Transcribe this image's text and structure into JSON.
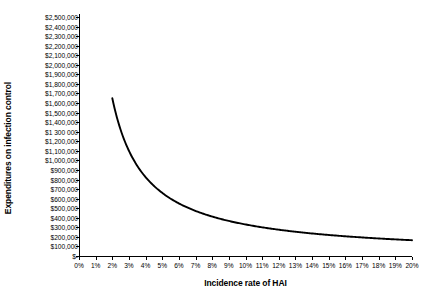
{
  "chart_data": {
    "type": "line",
    "title": "",
    "xlabel": "Incidence rate of HAI",
    "ylabel": "Expenditures on infection control",
    "xlim": [
      0,
      20
    ],
    "ylim": [
      0,
      2500000
    ],
    "grid": false,
    "legend": "none",
    "line_color": "#000000",
    "background_color": "#ffffff",
    "axis_color": "#000000",
    "x_tick_labels": [
      "0%",
      "1%",
      "2%",
      "3%",
      "4%",
      "5%",
      "6%",
      "7%",
      "8%",
      "9%",
      "10%",
      "11%",
      "12%",
      "13%",
      "14%",
      "15%",
      "16%",
      "17%",
      "18%",
      "19%",
      "20%"
    ],
    "x_tick_values": [
      0,
      1,
      2,
      3,
      4,
      5,
      6,
      7,
      8,
      9,
      10,
      11,
      12,
      13,
      14,
      15,
      16,
      17,
      18,
      19,
      20
    ],
    "y_tick_labels": [
      "$2,500,000",
      "$2,400,000",
      "$2,300,000",
      "$2,200,000",
      "$2,100,000",
      "$2,000,000",
      "$1,900,000",
      "$1,800,000",
      "$1,700,000",
      "$1,600,000",
      "$1,500,000",
      "$1,400,000",
      "$1 300 000",
      "$1,200,000",
      "$1,100,000",
      "$1,000,000",
      "$900,000",
      "$800,000",
      "$700,000",
      "$600,000",
      "$500,000",
      "$400,000",
      "$300,000",
      "$200,000",
      "$100,000",
      "$-"
    ],
    "y_tick_values": [
      2500000,
      2400000,
      2300000,
      2200000,
      2100000,
      2000000,
      1900000,
      1800000,
      1700000,
      1600000,
      1500000,
      1400000,
      1300000,
      1200000,
      1100000,
      1000000,
      900000,
      800000,
      700000,
      600000,
      500000,
      400000,
      300000,
      200000,
      100000,
      0
    ],
    "x": [
      2.0,
      2.5,
      3.0,
      3.5,
      4.0,
      4.5,
      5.0,
      5.5,
      6.0,
      6.5,
      7.0,
      7.5,
      8.0,
      8.5,
      9.0,
      9.5,
      10.0,
      10.5,
      11.0,
      11.5,
      12.0,
      12.5,
      13.0,
      13.5,
      14.0,
      14.5,
      15.0,
      15.5,
      16.0,
      16.5,
      17.0,
      17.5,
      18.0,
      18.5,
      19.0,
      19.5,
      20.0
    ],
    "values": [
      1650000,
      1320000,
      1100000,
      942857,
      825000,
      733333,
      660000,
      600000,
      550000,
      507692,
      471429,
      440000,
      412500,
      388235,
      366667,
      347368,
      330000,
      314286,
      300000,
      286957,
      275000,
      264000,
      253846,
      244444,
      235714,
      227586,
      220000,
      212903,
      206250,
      200000,
      194118,
      188571,
      183333,
      178378,
      173684,
      169231,
      165000
    ],
    "series_name": "Expenditures on infection control"
  }
}
